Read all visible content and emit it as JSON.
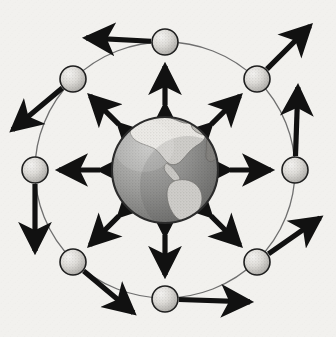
{
  "figure": {
    "width": 336,
    "height": 337,
    "background_color": "#f2f1ee",
    "texture": "scanned-paper-halftone"
  },
  "globe": {
    "label": "Earth globe",
    "center_x": 165,
    "center_y": 170,
    "radius": 54,
    "ocean_color": "#9a9a9a",
    "land_color": "#e8e6e2",
    "outline_color": "#2b2b2b",
    "shadow_color": "#6e6e6e",
    "highlight_color": "#c2c2c2",
    "visible_region": "Americas"
  },
  "orbit": {
    "label": "orbit ring",
    "center_x": 165,
    "center_y": 170,
    "radius_x": 130,
    "radius_y": 128,
    "stroke_color": "#6f6f6f",
    "stroke_width": 1.3
  },
  "node_style": {
    "radius": 13,
    "fill_light": "#f0efec",
    "fill_mid": "#d2d0cc",
    "fill_dark": "#a8a6a2",
    "outline_color": "#1f1f1f",
    "outline_width": 1.6
  },
  "arrow_style": {
    "color": "#111111",
    "shaft_width": 5.2,
    "head_length": 14,
    "head_width": 13,
    "spoke_type": "double-headed",
    "outward_type": "single-headed"
  },
  "nodes": [
    {
      "id": "node-n",
      "label": "satellite node north",
      "angle_deg": 270,
      "x": 165,
      "y": 42,
      "spoke": {
        "type": "double-headed",
        "toward": "globe"
      },
      "outward": {
        "type": "single-headed",
        "heading_deg": 183,
        "length": 66,
        "direction": "west"
      }
    },
    {
      "id": "node-ne",
      "label": "satellite node northeast",
      "angle_deg": 315,
      "x": 257,
      "y": 79,
      "spoke": {
        "type": "double-headed",
        "toward": "globe"
      },
      "outward": {
        "type": "single-headed",
        "heading_deg": 315,
        "length": 62,
        "direction": "northeast"
      }
    },
    {
      "id": "node-e",
      "label": "satellite node east",
      "angle_deg": 0,
      "x": 295,
      "y": 170,
      "spoke": {
        "type": "double-headed",
        "toward": "globe"
      },
      "outward": {
        "type": "single-headed",
        "heading_deg": 272,
        "length": 70,
        "direction": "north"
      }
    },
    {
      "id": "node-se",
      "label": "satellite node southeast",
      "angle_deg": 45,
      "x": 257,
      "y": 262,
      "spoke": {
        "type": "double-headed",
        "toward": "globe"
      },
      "outward": {
        "type": "single-headed",
        "heading_deg": 325,
        "length": 64,
        "direction": "northeast"
      }
    },
    {
      "id": "node-s",
      "label": "satellite node south",
      "angle_deg": 90,
      "x": 165,
      "y": 299,
      "spoke": {
        "type": "double-headed",
        "toward": "globe"
      },
      "outward": {
        "type": "single-headed",
        "heading_deg": 2,
        "length": 72,
        "direction": "east"
      }
    },
    {
      "id": "node-sw",
      "label": "satellite node southwest",
      "angle_deg": 135,
      "x": 73,
      "y": 262,
      "spoke": {
        "type": "double-headed",
        "toward": "globe"
      },
      "outward": {
        "type": "single-headed",
        "heading_deg": 40,
        "length": 66,
        "direction": "southeast"
      }
    },
    {
      "id": "node-w",
      "label": "satellite node west",
      "angle_deg": 180,
      "x": 35,
      "y": 170,
      "spoke": {
        "type": "double-headed",
        "toward": "globe"
      },
      "outward": {
        "type": "single-headed",
        "heading_deg": 90,
        "length": 68,
        "direction": "south"
      }
    },
    {
      "id": "node-nw",
      "label": "satellite node northwest",
      "angle_deg": 225,
      "x": 73,
      "y": 79,
      "spoke": {
        "type": "double-headed",
        "toward": "globe"
      },
      "outward": {
        "type": "single-headed",
        "heading_deg": 140,
        "length": 66,
        "direction": "southwest"
      }
    }
  ]
}
